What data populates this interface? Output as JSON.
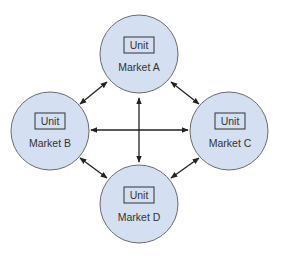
{
  "diagram": {
    "type": "network",
    "colors": {
      "node_fill": "#d4e0f2",
      "node_stroke": "#6b6b6b",
      "box_stroke": "#333333",
      "arrow": "#222222",
      "text": "#333333"
    },
    "nodes": [
      {
        "id": "A",
        "unit_label": "Unit",
        "label": "Market A",
        "cx": 139,
        "cy": 54
      },
      {
        "id": "B",
        "unit_label": "Unit",
        "label": "Market B",
        "cx": 50,
        "cy": 131
      },
      {
        "id": "C",
        "unit_label": "Unit",
        "label": "Market C",
        "cx": 229,
        "cy": 131
      },
      {
        "id": "D",
        "unit_label": "Unit",
        "label": "Market D",
        "cx": 139,
        "cy": 204
      }
    ],
    "edges": [
      {
        "from": "A",
        "to": "B",
        "direction": "bidirectional"
      },
      {
        "from": "A",
        "to": "C",
        "direction": "bidirectional"
      },
      {
        "from": "B",
        "to": "D",
        "direction": "bidirectional"
      },
      {
        "from": "C",
        "to": "D",
        "direction": "bidirectional"
      },
      {
        "from": "A",
        "to": "D",
        "direction": "bidirectional"
      },
      {
        "from": "B",
        "to": "C",
        "direction": "bidirectional"
      }
    ]
  }
}
